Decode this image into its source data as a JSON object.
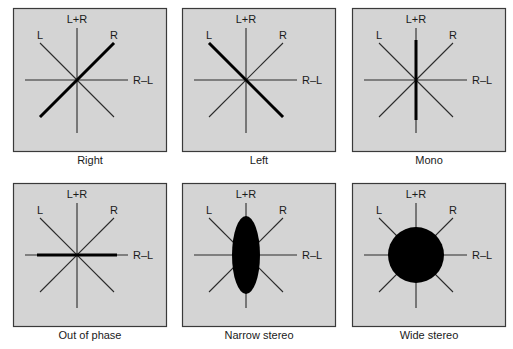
{
  "figure": {
    "colors": {
      "panel_fill": "#d4d4d4",
      "panel_border": "#3a3a3a",
      "line": "#2a2a2a",
      "emphasis": "#000000"
    },
    "axis_labels": {
      "top": "L+R",
      "upper_left": "L",
      "upper_right": "R",
      "right": "R–L"
    },
    "panels": [
      {
        "caption": "Right",
        "pattern": "thick diagonal along R axis"
      },
      {
        "caption": "Left",
        "pattern": "thick diagonal along L axis"
      },
      {
        "caption": "Mono",
        "pattern": "thick vertical along L+R axis"
      },
      {
        "caption": "Out of phase",
        "pattern": "thick horizontal along R–L axis"
      },
      {
        "caption": "Narrow stereo",
        "pattern": "tall narrow ellipse"
      },
      {
        "caption": "Wide stereo",
        "pattern": "large filled circle"
      }
    ]
  }
}
